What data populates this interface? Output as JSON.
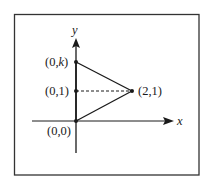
{
  "diagram": {
    "axes": {
      "x_label": "x",
      "y_label": "y"
    },
    "points": [
      {
        "id": "origin",
        "label": "(0,0)"
      },
      {
        "id": "p01",
        "label": "(0,1)"
      },
      {
        "id": "p0k",
        "label_prefix": "(0,",
        "label_var": "k",
        "label_suffix": ")"
      },
      {
        "id": "p21",
        "label": "(2,1)"
      }
    ],
    "segments": [
      {
        "from": "(0,0)",
        "to": "(0,k)",
        "style": "solid"
      },
      {
        "from": "(0,k)",
        "to": "(2,1)",
        "style": "solid"
      },
      {
        "from": "(0,0)",
        "to": "(2,1)",
        "style": "solid"
      },
      {
        "from": "(0,1)",
        "to": "(2,1)",
        "style": "dashed"
      }
    ],
    "colors": {
      "line": "#1a1a1a",
      "frame": "#333333",
      "background": "#ffffff"
    }
  }
}
